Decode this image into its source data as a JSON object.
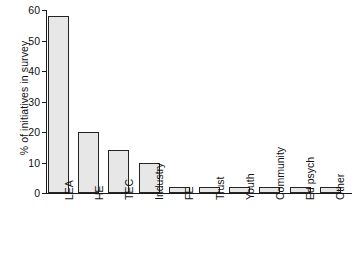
{
  "chart_data": {
    "type": "bar",
    "title": "",
    "subtitle": "",
    "xlabel": "",
    "ylabel": "% of initiatives in survey",
    "categories": [
      "LEA",
      "HE",
      "TEC",
      "Industry",
      "FE",
      "Trust",
      "Youth",
      "Community",
      "Ed psych",
      "Other"
    ],
    "values": [
      58,
      20,
      14,
      10,
      2,
      2,
      2,
      2,
      2,
      2
    ],
    "ylim": [
      0,
      60
    ],
    "ytick_labels": [
      "0",
      "10",
      "20",
      "30",
      "40",
      "50",
      "60"
    ],
    "ytick_values": [
      0,
      10,
      20,
      30,
      40,
      50,
      60
    ],
    "grid": false,
    "legend": false,
    "legend_position": "none",
    "bar_fill_color": "#e7e7e7",
    "bar_border_color": "#242424",
    "axis_color": "#1c1c1c",
    "background_color": "#ffffff"
  },
  "axis": {
    "y_title": "% of initiatives in survey",
    "ticks": [
      {
        "label": "60",
        "value": 60
      },
      {
        "label": "50",
        "value": 50
      },
      {
        "label": "40",
        "value": 40
      },
      {
        "label": "30",
        "value": 30
      },
      {
        "label": "20",
        "value": 20
      },
      {
        "label": "10",
        "value": 10
      },
      {
        "label": "0",
        "value": 0
      }
    ]
  },
  "bars": [
    {
      "label": "LEA",
      "value": 58
    },
    {
      "label": "HE",
      "value": 20
    },
    {
      "label": "TEC",
      "value": 14
    },
    {
      "label": "Industry",
      "value": 10
    },
    {
      "label": "FE",
      "value": 2
    },
    {
      "label": "Trust",
      "value": 2
    },
    {
      "label": "Youth",
      "value": 2
    },
    {
      "label": "Community",
      "value": 2
    },
    {
      "label": "Ed psych",
      "value": 2
    },
    {
      "label": "Other",
      "value": 2
    }
  ]
}
